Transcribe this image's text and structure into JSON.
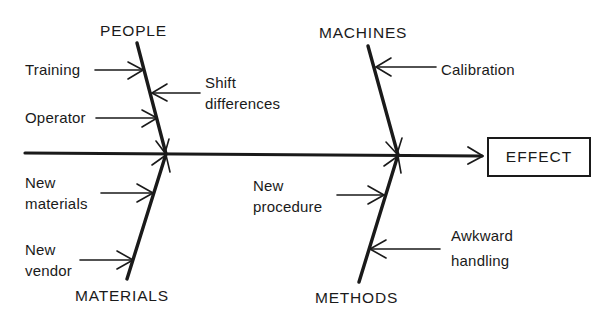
{
  "diagram": {
    "type": "fishbone (cause-and-effect)",
    "effect": "EFFECT",
    "stroke_color": "#1a1a1a",
    "categories": [
      {
        "name": "PEOPLE",
        "position": "top-left",
        "causes": [
          {
            "label": "Training",
            "lines": [
              "Training"
            ],
            "side": "left"
          },
          {
            "label": "Shift differences",
            "lines": [
              "Shift",
              "differences"
            ],
            "side": "right"
          },
          {
            "label": "Operator",
            "lines": [
              "Operator"
            ],
            "side": "left"
          }
        ]
      },
      {
        "name": "MACHINES",
        "position": "top-right",
        "causes": [
          {
            "label": "Calibration",
            "lines": [
              "Calibration"
            ],
            "side": "right"
          }
        ]
      },
      {
        "name": "MATERIALS",
        "position": "bottom-left",
        "causes": [
          {
            "label": "New materials",
            "lines": [
              "New",
              "materials"
            ],
            "side": "left"
          },
          {
            "label": "New vendor",
            "lines": [
              "New",
              "vendor"
            ],
            "side": "left"
          }
        ]
      },
      {
        "name": "METHODS",
        "position": "bottom-right",
        "causes": [
          {
            "label": "New procedure",
            "lines": [
              "New",
              "procedure"
            ],
            "side": "left"
          },
          {
            "label": "Awkward handling",
            "lines": [
              "Awkward",
              "handling"
            ],
            "side": "right"
          }
        ]
      }
    ]
  }
}
